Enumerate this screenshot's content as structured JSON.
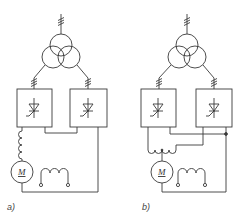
{
  "diagram": {
    "type": "electrical-schematic",
    "line_color": "#3a3a3a",
    "background": "#ffffff",
    "panels": [
      {
        "id": "a",
        "label": "a)",
        "motor_label": "M",
        "components": [
          "three-winding-transformer",
          "thyristor-converter-1",
          "thyristor-converter-2",
          "series-inductor",
          "dc-motor",
          "field-winding"
        ]
      },
      {
        "id": "b",
        "label": "b)",
        "motor_label": "M",
        "components": [
          "three-winding-transformer",
          "thyristor-converter-1",
          "thyristor-converter-2",
          "center-tapped-reactor",
          "dc-motor",
          "field-winding",
          "junction-dot"
        ]
      }
    ]
  }
}
